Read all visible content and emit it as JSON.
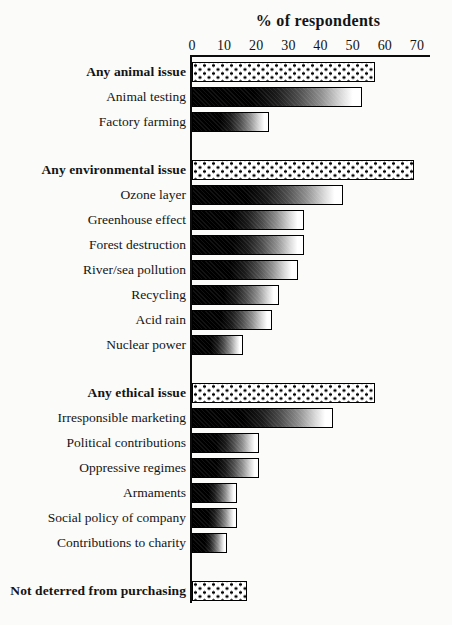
{
  "page": {
    "background_color": "#fbfbf9",
    "text_color": "#141414"
  },
  "chart_data": {
    "type": "bar",
    "orientation": "horizontal",
    "title": "% of respondents",
    "xlabel": "% of respondents",
    "ylabel": "",
    "xlim": [
      0,
      70
    ],
    "x_ticks": [
      0,
      10,
      20,
      30,
      40,
      50,
      60,
      70
    ],
    "grid": false,
    "legend": null,
    "bar_styles": {
      "dotted": "white bar with black polka-dot pattern (summary categories)",
      "gradient": "solid black fading to white toward the right (individual issues)"
    },
    "colors": {
      "bar_border": "#000000",
      "dotted_dot": "#050505",
      "gradient_start": "#000000",
      "gradient_end": "#ffffff",
      "axis": "#0c0c0c"
    },
    "rows": [
      {
        "label": "Any animal issue",
        "value": 57,
        "pattern": "dotted",
        "bold": true,
        "gap_before": false
      },
      {
        "label": "Animal testing",
        "value": 53,
        "pattern": "gradient",
        "bold": false,
        "gap_before": false
      },
      {
        "label": "Factory farming",
        "value": 24,
        "pattern": "gradient",
        "bold": false,
        "gap_before": false
      },
      {
        "label": "Any environmental issue",
        "value": 69,
        "pattern": "dotted",
        "bold": true,
        "gap_before": true
      },
      {
        "label": "Ozone layer",
        "value": 47,
        "pattern": "gradient",
        "bold": false,
        "gap_before": false
      },
      {
        "label": "Greenhouse effect",
        "value": 35,
        "pattern": "gradient",
        "bold": false,
        "gap_before": false
      },
      {
        "label": "Forest destruction",
        "value": 35,
        "pattern": "gradient",
        "bold": false,
        "gap_before": false
      },
      {
        "label": "River/sea pollution",
        "value": 33,
        "pattern": "gradient",
        "bold": false,
        "gap_before": false
      },
      {
        "label": "Recycling",
        "value": 27,
        "pattern": "gradient",
        "bold": false,
        "gap_before": false
      },
      {
        "label": "Acid rain",
        "value": 25,
        "pattern": "gradient",
        "bold": false,
        "gap_before": false
      },
      {
        "label": "Nuclear power",
        "value": 16,
        "pattern": "gradient",
        "bold": false,
        "gap_before": false
      },
      {
        "label": "Any ethical issue",
        "value": 57,
        "pattern": "dotted",
        "bold": true,
        "gap_before": true
      },
      {
        "label": "Irresponsible marketing",
        "value": 44,
        "pattern": "gradient",
        "bold": false,
        "gap_before": false
      },
      {
        "label": "Political contributions",
        "value": 21,
        "pattern": "gradient",
        "bold": false,
        "gap_before": false
      },
      {
        "label": "Oppressive regimes",
        "value": 21,
        "pattern": "gradient",
        "bold": false,
        "gap_before": false
      },
      {
        "label": "Armaments",
        "value": 14,
        "pattern": "gradient",
        "bold": false,
        "gap_before": false
      },
      {
        "label": "Social policy of company",
        "value": 14,
        "pattern": "gradient",
        "bold": false,
        "gap_before": false
      },
      {
        "label": "Contributions to charity",
        "value": 11,
        "pattern": "gradient",
        "bold": false,
        "gap_before": false
      },
      {
        "label": "Not deterred from purchasing",
        "value": 17,
        "pattern": "dotted",
        "bold": true,
        "gap_before": true
      }
    ]
  }
}
